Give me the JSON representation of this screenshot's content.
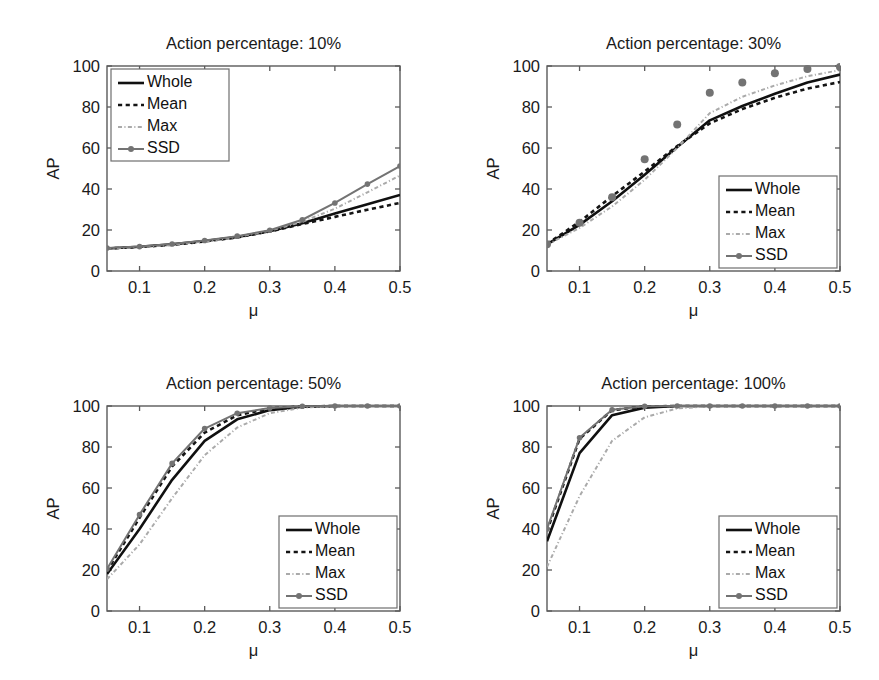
{
  "figure": {
    "name": "ap-vs-mu-multi-panel-figure",
    "background": "#ffffff",
    "panel_count": 4
  },
  "style": {
    "whole_color": "#101010",
    "mean_color": "#141414",
    "max_color": "#aaaaaa",
    "ssd_color": "#737373",
    "axis_color": "#5a5a5a",
    "text_color": "#1a1a1a"
  },
  "chart_data": [
    {
      "type": "line",
      "title": "Action percentage: 10%",
      "xlabel": "μ",
      "ylabel": "AP",
      "xlim": [
        0.05,
        0.5
      ],
      "ylim": [
        0,
        100
      ],
      "xticks": [
        0.1,
        0.2,
        0.3,
        0.4,
        0.5
      ],
      "xticklabels": [
        "0.1",
        "0.2",
        "0.3",
        "0.4",
        "0.5"
      ],
      "yticks": [
        0,
        20,
        40,
        60,
        80,
        100
      ],
      "yticklabels": [
        "0",
        "20",
        "40",
        "60",
        "80",
        "100"
      ],
      "grid": false,
      "legend_position": "upper left",
      "x": [
        0.05,
        0.1,
        0.15,
        0.2,
        0.25,
        0.3,
        0.35,
        0.4,
        0.45,
        0.5
      ],
      "series": [
        {
          "name": "Whole",
          "style": "solid",
          "marker": "none",
          "values": [
            11.0,
            11.8,
            13.0,
            14.6,
            16.6,
            19.4,
            23.3,
            28.0,
            32.6,
            37.1
          ]
        },
        {
          "name": "Mean",
          "style": "dashed",
          "marker": "none",
          "values": [
            11.0,
            11.7,
            12.8,
            14.4,
            16.4,
            19.3,
            22.9,
            26.4,
            29.9,
            33.2
          ]
        },
        {
          "name": "Max",
          "style": "dashdot",
          "marker": "none",
          "values": [
            10.9,
            11.6,
            12.8,
            14.4,
            16.6,
            19.6,
            24.0,
            30.4,
            38.4,
            46.6
          ]
        },
        {
          "name": "SSD",
          "style": "solid",
          "marker": "circle",
          "values": [
            11.2,
            11.9,
            13.2,
            14.9,
            17.0,
            19.9,
            25.0,
            33.2,
            42.4,
            51.2
          ]
        }
      ]
    },
    {
      "type": "line",
      "title": "Action percentage: 30%",
      "xlabel": "μ",
      "ylabel": "AP",
      "xlim": [
        0.05,
        0.5
      ],
      "ylim": [
        0,
        100
      ],
      "xticks": [
        0.1,
        0.2,
        0.3,
        0.4,
        0.5
      ],
      "xticklabels": [
        "0.1",
        "0.2",
        "0.3",
        "0.4",
        "0.5"
      ],
      "yticks": [
        0,
        20,
        40,
        60,
        80,
        100
      ],
      "yticklabels": [
        "0",
        "20",
        "40",
        "60",
        "80",
        "100"
      ],
      "grid": false,
      "legend_position": "lower right",
      "x": [
        0.05,
        0.1,
        0.15,
        0.2,
        0.25,
        0.3,
        0.35,
        0.4,
        0.45,
        0.5
      ],
      "series": [
        {
          "name": "Whole",
          "style": "solid",
          "marker": "none",
          "values": [
            13.0,
            22.5,
            34.0,
            47.0,
            60.5,
            73.5,
            80.5,
            86.5,
            92.0,
            95.8
          ]
        },
        {
          "name": "Mean",
          "style": "dashed",
          "marker": "none",
          "values": [
            13.2,
            24.0,
            36.5,
            48.5,
            61.0,
            72.0,
            79.0,
            84.5,
            89.0,
            92.2
          ]
        },
        {
          "name": "Max",
          "style": "dashdot",
          "marker": "none",
          "values": [
            12.8,
            21.0,
            31.5,
            44.5,
            60.0,
            77.0,
            85.0,
            90.5,
            95.0,
            98.0
          ]
        },
        {
          "name": "SSD",
          "style": "none",
          "marker": "circle",
          "values": [
            13.0,
            23.5,
            36.0,
            54.5,
            71.5,
            87.0,
            92.0,
            96.5,
            98.5,
            99.5
          ]
        }
      ]
    },
    {
      "type": "line",
      "title": "Action percentage: 50%",
      "xlabel": "μ",
      "ylabel": "AP",
      "xlim": [
        0.05,
        0.5
      ],
      "ylim": [
        0,
        100
      ],
      "xticks": [
        0.1,
        0.2,
        0.3,
        0.4,
        0.5
      ],
      "xticklabels": [
        "0.1",
        "0.2",
        "0.3",
        "0.4",
        "0.5"
      ],
      "yticks": [
        0,
        20,
        40,
        60,
        80,
        100
      ],
      "yticklabels": [
        "0",
        "20",
        "40",
        "60",
        "80",
        "100"
      ],
      "grid": false,
      "legend_position": "lower right",
      "x": [
        0.05,
        0.1,
        0.15,
        0.2,
        0.25,
        0.3,
        0.35,
        0.4,
        0.45,
        0.5
      ],
      "series": [
        {
          "name": "Whole",
          "style": "solid",
          "marker": "none",
          "values": [
            18.0,
            40.0,
            64.0,
            83.0,
            93.5,
            98.0,
            99.6,
            100.0,
            100.0,
            100.0
          ]
        },
        {
          "name": "Mean",
          "style": "dashed",
          "marker": "none",
          "values": [
            19.5,
            45.5,
            70.5,
            87.0,
            95.5,
            98.8,
            99.8,
            100.0,
            100.0,
            100.0
          ]
        },
        {
          "name": "Max",
          "style": "dashdot",
          "marker": "none",
          "values": [
            15.5,
            32.5,
            55.0,
            76.0,
            89.5,
            96.5,
            99.2,
            100.0,
            100.0,
            100.0
          ]
        },
        {
          "name": "SSD",
          "style": "solid",
          "marker": "circle",
          "values": [
            20.5,
            47.0,
            72.0,
            89.0,
            96.5,
            99.0,
            99.9,
            100.0,
            100.0,
            100.0
          ]
        }
      ]
    },
    {
      "type": "line",
      "title": "Action percentage: 100%",
      "xlabel": "μ",
      "ylabel": "AP",
      "xlim": [
        0.05,
        0.5
      ],
      "ylim": [
        0,
        100
      ],
      "xticks": [
        0.1,
        0.2,
        0.3,
        0.4,
        0.5
      ],
      "xticklabels": [
        "0.1",
        "0.2",
        "0.3",
        "0.4",
        "0.5"
      ],
      "yticks": [
        0,
        20,
        40,
        60,
        80,
        100
      ],
      "yticklabels": [
        "0",
        "20",
        "40",
        "60",
        "80",
        "100"
      ],
      "grid": false,
      "legend_position": "lower right",
      "x": [
        0.05,
        0.1,
        0.15,
        0.2,
        0.25,
        0.3,
        0.35,
        0.4,
        0.45,
        0.5
      ],
      "series": [
        {
          "name": "Whole",
          "style": "solid",
          "marker": "none",
          "values": [
            34.0,
            77.0,
            95.5,
            99.2,
            100.0,
            100.0,
            100.0,
            100.0,
            100.0,
            100.0
          ]
        },
        {
          "name": "Mean",
          "style": "dashed",
          "marker": "none",
          "values": [
            39.0,
            84.0,
            98.0,
            99.8,
            100.0,
            100.0,
            100.0,
            100.0,
            100.0,
            100.0
          ]
        },
        {
          "name": "Max",
          "style": "dashdot",
          "marker": "none",
          "values": [
            21.5,
            56.0,
            83.0,
            94.5,
            98.8,
            99.8,
            100.0,
            100.0,
            100.0,
            100.0
          ]
        },
        {
          "name": "SSD",
          "style": "solid",
          "marker": "circle",
          "values": [
            40.0,
            84.5,
            98.2,
            99.9,
            100.0,
            100.0,
            100.0,
            100.0,
            100.0,
            100.0
          ]
        }
      ]
    }
  ],
  "legend": {
    "entries": [
      {
        "label": "Whole",
        "style": "solid",
        "marker": "none"
      },
      {
        "label": "Mean",
        "style": "dashed",
        "marker": "none"
      },
      {
        "label": "Max",
        "style": "dashdot",
        "marker": "none"
      },
      {
        "label": "SSD",
        "style": "solid",
        "marker": "circle"
      }
    ]
  }
}
